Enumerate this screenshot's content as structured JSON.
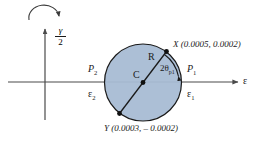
{
  "figure": {
    "type": "mohr-circle-strain-diagram",
    "axes": {
      "horizontal_label": "ε",
      "vertical_label_numerator": "γ",
      "vertical_label_denominator": "2"
    },
    "rotation_arrow": {
      "name": "clockwise-rotation-arrow",
      "direction": "clockwise"
    },
    "circle": {
      "center_label": "C",
      "radius_label": "R",
      "fill_color": "#a8bcd4",
      "stroke_color": "#1a1a1a"
    },
    "angle_annotation": {
      "value": "2θ",
      "subscript": "p1"
    },
    "points": [
      {
        "name": "point-x",
        "label": "X (0.0005, 0.0002)",
        "symbol": "X",
        "coords_text": "(0.0005, 0.0002)"
      },
      {
        "name": "point-y",
        "label": "Y (0.0003, – 0.0002)",
        "symbol": "Y",
        "coords_text": "(0.0003, – 0.0002)"
      }
    ],
    "principal_labels": {
      "p1": "P",
      "p1_sub": "1",
      "p2": "P",
      "p2_sub": "2",
      "eps1": "ε",
      "eps1_sub": "1",
      "eps2": "ε",
      "eps2_sub": "2"
    }
  }
}
